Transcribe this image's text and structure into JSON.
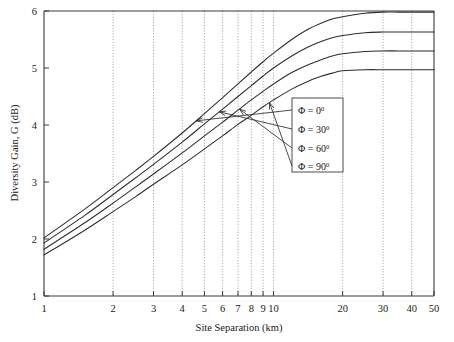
{
  "chart_data": {
    "type": "line",
    "title": "",
    "xlabel": "Site Separation (km)",
    "ylabel": "Diversity Gain, G (dB)",
    "xscale": "log",
    "yscale": "linear",
    "xlim": [
      1,
      50
    ],
    "ylim": [
      1,
      6
    ],
    "xticks": [
      1,
      2,
      3,
      4,
      5,
      6,
      7,
      8,
      9,
      10,
      20,
      30,
      40,
      50
    ],
    "xtick_labels": [
      "1",
      "2",
      "3",
      "4",
      "5",
      "6",
      "7",
      "8",
      "9",
      "10",
      "20",
      "30",
      "40",
      "50"
    ],
    "yticks": [
      1,
      2,
      3,
      4,
      5,
      6
    ],
    "ytick_labels": [
      "1",
      "2",
      "3",
      "4",
      "5",
      "6"
    ],
    "grid": "vertical-dotted-at-x-ticks",
    "legend_position": "inside-right-middle",
    "x": [
      1,
      1.5,
      2,
      2.5,
      3,
      4,
      5,
      6,
      7,
      8,
      9,
      10,
      12,
      14,
      16,
      18,
      20,
      25,
      30,
      35,
      40,
      45,
      50
    ],
    "series": [
      {
        "name": "Φ = 0°",
        "label_main": "Φ = 0",
        "label_sup": "0",
        "values": [
          2.02,
          2.52,
          2.9,
          3.2,
          3.45,
          3.86,
          4.2,
          4.48,
          4.72,
          4.93,
          5.11,
          5.26,
          5.5,
          5.67,
          5.78,
          5.86,
          5.9,
          5.96,
          5.98,
          5.98,
          5.98,
          5.98,
          5.98
        ]
      },
      {
        "name": "Φ = 30°",
        "label_main": "Φ = 30",
        "label_sup": "0",
        "values": [
          1.93,
          2.41,
          2.78,
          3.07,
          3.31,
          3.7,
          4.02,
          4.28,
          4.5,
          4.69,
          4.86,
          5.0,
          5.21,
          5.36,
          5.46,
          5.53,
          5.57,
          5.62,
          5.63,
          5.63,
          5.63,
          5.63,
          5.63
        ]
      },
      {
        "name": "Φ = 60°",
        "label_main": "Φ = 60",
        "label_sup": "0",
        "values": [
          1.82,
          2.28,
          2.63,
          2.91,
          3.14,
          3.51,
          3.81,
          4.05,
          4.26,
          4.44,
          4.59,
          4.72,
          4.92,
          5.05,
          5.14,
          5.21,
          5.25,
          5.29,
          5.3,
          5.3,
          5.3,
          5.3,
          5.3
        ]
      },
      {
        "name": "Φ = 90°",
        "label_main": "Φ = 90",
        "label_sup": "0",
        "values": [
          1.72,
          2.15,
          2.48,
          2.74,
          2.96,
          3.3,
          3.58,
          3.81,
          4.01,
          4.17,
          4.32,
          4.44,
          4.63,
          4.76,
          4.85,
          4.91,
          4.95,
          4.97,
          4.97,
          4.97,
          4.97,
          4.97,
          4.97
        ]
      }
    ],
    "annotations": [
      {
        "text": "Φ = 0°",
        "points_to_series": 0,
        "points_to_x": 4.6
      },
      {
        "text": "Φ = 30°",
        "points_to_series": 1,
        "points_to_x": 5.8
      },
      {
        "text": "Φ = 60°",
        "points_to_series": 2,
        "points_to_x": 7.1
      },
      {
        "text": "Φ = 90°",
        "points_to_series": 3,
        "points_to_x": 9.6
      }
    ]
  },
  "legend": {
    "items": [
      {
        "main": "Φ = 0",
        "sup": "0"
      },
      {
        "main": "Φ = 30",
        "sup": "0"
      },
      {
        "main": "Φ = 60",
        "sup": "0"
      },
      {
        "main": "Φ = 90",
        "sup": "0"
      }
    ]
  },
  "axes": {
    "x_title": "Site Separation (km)",
    "y_title": "Diversity Gain, G (dB)"
  }
}
